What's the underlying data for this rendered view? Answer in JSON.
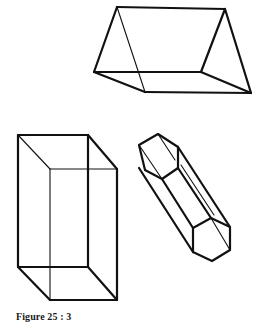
{
  "figure": {
    "caption": "Figure 25 : 3",
    "shapes": [
      {
        "name": "triangular-prism",
        "description": "Triangular prism lying on rectangular face"
      },
      {
        "name": "rectangular-box",
        "description": "Upright rectangular cuboid (transparent wireframe)"
      },
      {
        "name": "hexagonal-prism",
        "description": "Tilted hexagonal prism"
      }
    ],
    "colors": {
      "line": "#111111",
      "background": "#ffffff"
    }
  }
}
